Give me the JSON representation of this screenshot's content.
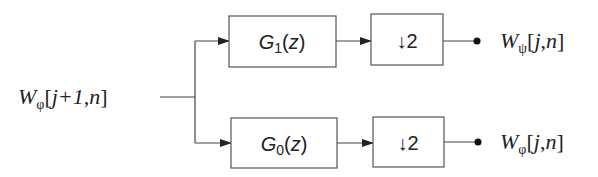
{
  "diagram": {
    "type": "filter-bank",
    "input": {
      "W": "W",
      "sub": "φ",
      "args": "[j+1,n]",
      "args_j1": "j+",
      "args_one": "1",
      "args_n": ",n]",
      "open": "["
    },
    "branches": [
      {
        "filter": {
          "G": "G",
          "sub": "1",
          "z": "(z)"
        },
        "downsample": "↓2",
        "output": {
          "W": "W",
          "sub": "ψ",
          "open": "[",
          "j": "j",
          "comma": ",",
          "n": "n",
          "close": "]"
        }
      },
      {
        "filter": {
          "G": "G",
          "sub": "0",
          "z": "(z)"
        },
        "downsample": "↓2",
        "output": {
          "W": "W",
          "sub": "φ",
          "open": "[",
          "j": "j",
          "comma": ",",
          "n": "n",
          "close": "]"
        }
      }
    ]
  }
}
